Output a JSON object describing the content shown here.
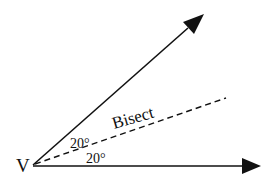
{
  "diagram": {
    "vertex": {
      "label": "V",
      "x": 33,
      "y": 165
    },
    "rays": [
      {
        "name": "upper-ray",
        "from": [
          33,
          165
        ],
        "to": [
          204,
          14
        ],
        "style": "solid",
        "arrow": true
      },
      {
        "name": "lower-ray",
        "from": [
          33,
          165
        ],
        "to": [
          261,
          166
        ],
        "style": "solid",
        "arrow": true
      },
      {
        "name": "bisector",
        "from": [
          33,
          165
        ],
        "to": [
          226,
          98
        ],
        "style": "dashed",
        "arrow": false
      }
    ],
    "labels": {
      "bisect": "Bisect",
      "upper_angle": "20°",
      "lower_angle": "20°"
    },
    "colors": {
      "stroke": "#111111",
      "background": "#ffffff"
    }
  }
}
